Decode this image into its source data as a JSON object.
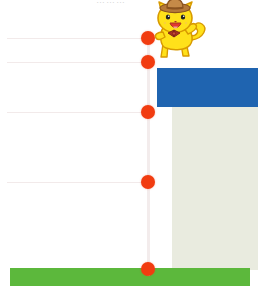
{
  "chart_data": {
    "type": "scatter",
    "title": "",
    "xlabel": "",
    "ylabel": "",
    "grid": true,
    "legend": "none",
    "x": [
      148,
      148,
      148,
      148,
      148
    ],
    "values": [
      38,
      62,
      112,
      182,
      269
    ],
    "point_labels": [
      "",
      "",
      "",
      "",
      ""
    ],
    "gridline_y": [
      38,
      62,
      112,
      182
    ],
    "series": [
      {
        "name": "markers",
        "color": "#f13c10",
        "values": [
          38,
          62,
          112,
          182,
          269
        ]
      }
    ],
    "blocks": [
      {
        "name": "blue-block",
        "color": "#1f64b0",
        "x": 157,
        "y": 68,
        "w": 101,
        "h": 39
      },
      {
        "name": "gray-block",
        "color": "#e9ebdf",
        "x": 172,
        "y": 107,
        "w": 86,
        "h": 163
      },
      {
        "name": "green-band",
        "color": "#5cb83c",
        "x": 10,
        "y": 268,
        "w": 240,
        "h": 18
      }
    ]
  },
  "header": {
    "clipped_title": "………"
  },
  "stem": {
    "color": "#f3ecec",
    "x": 147,
    "top": 35,
    "bottom": 276
  },
  "mascot": {
    "name": "yellow-cat-mascot",
    "body_color": "#ffe11a",
    "outline_color": "#d89a00",
    "hat_color": "#b5793a",
    "hat_band_color": "#8a5320",
    "bowtie_color": "#a83224",
    "mouth_color": "#e23a2e",
    "tongue_color": "#f4a0a0",
    "eye_color": "#222222",
    "label": "cat mascot with cowboy hat"
  },
  "colors": {
    "marker": "#f13c10",
    "grid": "#f2eaea",
    "blue": "#1f64b0",
    "gray": "#e9ebdf",
    "green": "#5cb83c",
    "background": "#ffffff"
  }
}
